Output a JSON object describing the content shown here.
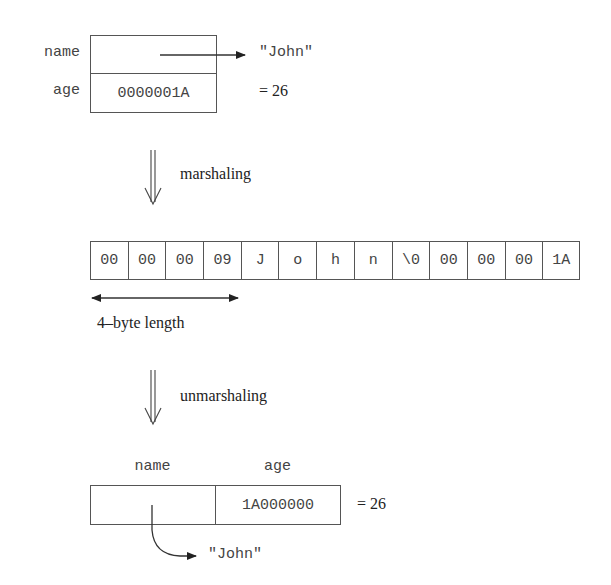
{
  "struct_before": {
    "fields": [
      {
        "label": "name",
        "value": ""
      },
      {
        "label": "age",
        "value": "0000001A"
      }
    ],
    "name_points_to": "\"John\"",
    "age_decimal": "= 26"
  },
  "marshal_step": {
    "label": "marshaling"
  },
  "bytes": {
    "cells": [
      "00",
      "00",
      "00",
      "09",
      "J",
      "o",
      "h",
      "n",
      "\\0",
      "00",
      "00",
      "00",
      "1A"
    ],
    "length_annotation": "4–byte length"
  },
  "unmarshal_step": {
    "label": "unmarshaling"
  },
  "struct_after": {
    "headers": [
      "name",
      "age"
    ],
    "values": [
      "",
      "1A000000"
    ],
    "name_points_to": "\"John\"",
    "age_decimal": "= 26"
  },
  "colors": {
    "stroke": "#555555",
    "text": "#444444"
  }
}
